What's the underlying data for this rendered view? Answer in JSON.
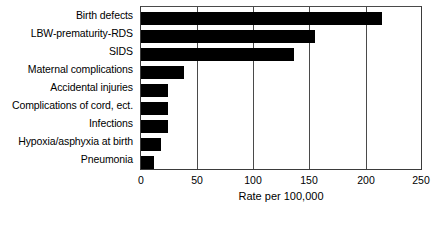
{
  "chart_data": {
    "type": "bar",
    "orientation": "horizontal",
    "title": "",
    "xlabel": "Rate per 100,000",
    "ylabel": "",
    "xlim": [
      0,
      250
    ],
    "xticks": [
      0,
      50,
      100,
      150,
      200,
      250
    ],
    "grid": true,
    "grid_axis": "x",
    "legend": false,
    "bar_color": "#000000",
    "categories": [
      "Birth defects",
      "LBW-prematurity-RDS",
      "SIDS",
      "Maternal complications",
      "Accidental injuries",
      "Complications of cord, ect.",
      "Infections",
      "Hypoxia/asphyxia at birth",
      "Pneumonia"
    ],
    "values": [
      215,
      155,
      137,
      38,
      24,
      24,
      24,
      18,
      12
    ]
  },
  "axis": {
    "x_title": "Rate per 100,000",
    "tick_labels": [
      "0",
      "50",
      "100",
      "150",
      "200",
      "250"
    ]
  }
}
